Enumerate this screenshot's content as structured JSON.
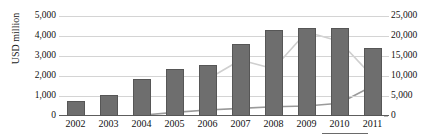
{
  "chart_data": {
    "type": "bar",
    "title": "",
    "xlabel": "",
    "ylabel": "USD million",
    "y2label": "",
    "categories": [
      "2002",
      "2003",
      "2004",
      "2005",
      "2006",
      "2007",
      "2008",
      "2009",
      "2010",
      "2011"
    ],
    "ylim": [
      0,
      5000
    ],
    "y2lim": [
      0,
      25000
    ],
    "yticks": [
      "0",
      "1,000",
      "2,000",
      "3,000",
      "4,000",
      "5,000"
    ],
    "ytick_values": [
      0,
      1000,
      2000,
      3000,
      4000,
      5000
    ],
    "y2ticks": [
      "0",
      "5,000",
      "10,000",
      "15,000",
      "20,000",
      "25,000"
    ],
    "y2tick_values": [
      0,
      5000,
      10000,
      15000,
      20000,
      25000
    ],
    "grid": true,
    "legend": "none",
    "series": [
      {
        "name": "bars",
        "type": "bar",
        "axis": "left",
        "color": "#6e6e6e",
        "values": [
          750,
          1050,
          1850,
          2350,
          2530,
          3580,
          4320,
          4400,
          4390,
          3400
        ]
      },
      {
        "name": "line-light",
        "type": "line",
        "axis": "right",
        "color": "#cfcfcf",
        "values": [
          null,
          null,
          null,
          null,
          9200,
          14000,
          11800,
          21000,
          18700,
          9900
        ]
      },
      {
        "name": "line-dark",
        "type": "line",
        "axis": "right",
        "color": "#9a9a9a",
        "values": [
          null,
          null,
          200,
          900,
          1500,
          1900,
          2300,
          2500,
          3200,
          7500
        ]
      }
    ]
  },
  "axes": {
    "y_title": "USD million"
  }
}
